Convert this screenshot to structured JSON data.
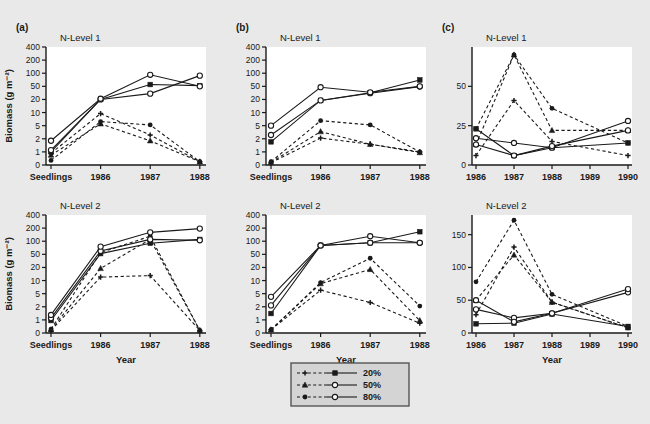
{
  "figure": {
    "background_color": "#e9e9e9",
    "plot_background_color": "#ffffff",
    "ink_color": "#1a1a1a"
  },
  "axis_titles": {
    "y": "Biomass (g m⁻²)",
    "x": "Year"
  },
  "legend": {
    "position": "bottom-center",
    "border_color": "#555555",
    "background_color": "#d4d4d4",
    "entries": [
      {
        "label": "20%",
        "dashed_marker": "plus",
        "solid_marker": "filled-square"
      },
      {
        "label": "50%",
        "dashed_marker": "filled-triangle",
        "solid_marker": "open-circle"
      },
      {
        "label": "80%",
        "dashed_marker": "filled-circle",
        "solid_marker": "open-circle"
      }
    ]
  },
  "panels": [
    {
      "id": "a-top",
      "panel_label": "(a)",
      "title": "N-Level 1",
      "scale": "log",
      "ytick_labels": [
        "0",
        "1",
        "2",
        "5",
        "10",
        "20",
        "50",
        "100",
        "200",
        "400"
      ],
      "ytick_values": [
        0,
        1,
        2,
        5,
        10,
        20,
        50,
        100,
        200,
        400
      ],
      "xtick_labels": [
        "Seedlings",
        "1986",
        "1987",
        "1988"
      ],
      "show_ylabel": true,
      "show_xlabel": false
    },
    {
      "id": "b-top",
      "panel_label": "(b)",
      "title": "N-Level 1",
      "scale": "log",
      "ytick_labels": [
        "0",
        "1",
        "2",
        "5",
        "10",
        "20",
        "50",
        "100",
        "200",
        "400"
      ],
      "ytick_values": [
        0,
        1,
        2,
        5,
        10,
        20,
        50,
        100,
        200,
        400
      ],
      "xtick_labels": [
        "Seedlings",
        "1986",
        "1987",
        "1988"
      ],
      "show_ylabel": false,
      "show_xlabel": false
    },
    {
      "id": "c-top",
      "panel_label": "(c)",
      "title": "N-Level 1",
      "scale": "linear",
      "ytick_labels": [
        "0",
        "25",
        "50"
      ],
      "ytick_values": [
        0,
        25,
        50
      ],
      "ylim": [
        0,
        75
      ],
      "xtick_labels": [
        "1986",
        "1987",
        "1988",
        "1989",
        "1990"
      ],
      "show_ylabel": false,
      "show_xlabel": false
    },
    {
      "id": "a-bottom",
      "panel_label": "",
      "title": "N-Level 2",
      "scale": "log",
      "ytick_labels": [
        "0",
        "1",
        "2",
        "5",
        "10",
        "20",
        "50",
        "100",
        "200",
        "400"
      ],
      "ytick_values": [
        0,
        1,
        2,
        5,
        10,
        20,
        50,
        100,
        200,
        400
      ],
      "xtick_labels": [
        "Seedlings",
        "1986",
        "1987",
        "1988"
      ],
      "show_ylabel": true,
      "show_xlabel": true
    },
    {
      "id": "b-bottom",
      "panel_label": "",
      "title": "N-Level 2",
      "scale": "log",
      "ytick_labels": [
        "0",
        "1",
        "2",
        "5",
        "10",
        "20",
        "50",
        "100",
        "200",
        "400"
      ],
      "ytick_values": [
        0,
        1,
        2,
        5,
        10,
        20,
        50,
        100,
        200,
        400
      ],
      "xtick_labels": [
        "Seedlings",
        "1986",
        "1987",
        "1988"
      ],
      "show_ylabel": false,
      "show_xlabel": true
    },
    {
      "id": "c-bottom",
      "panel_label": "",
      "title": "N-Level 2",
      "scale": "linear",
      "ytick_labels": [
        "0",
        "50",
        "100",
        "150"
      ],
      "ytick_values": [
        0,
        50,
        100,
        150
      ],
      "ylim": [
        0,
        180
      ],
      "xtick_labels": [
        "1986",
        "1987",
        "1988",
        "1989",
        "1990"
      ],
      "show_ylabel": false,
      "show_xlabel": true
    }
  ],
  "chart_data": [
    {
      "id": "a-top",
      "type": "line",
      "title": "N-Level 1",
      "panel_label": "(a)",
      "xlabel": "",
      "ylabel": "Biomass (g m⁻²)",
      "yscale": "log",
      "ylim": [
        0,
        400
      ],
      "grid": false,
      "categories": [
        "Seedlings",
        "1986",
        "1987",
        "1988"
      ],
      "series": [
        {
          "name": "20% dashed",
          "marker": "plus",
          "linestyle": "dashed",
          "values": [
            0.9,
            9.5,
            2.6,
            0.25
          ]
        },
        {
          "name": "50% dashed",
          "marker": "filled-triangle",
          "linestyle": "dashed",
          "values": [
            0.75,
            5.5,
            1.8,
            0.25
          ]
        },
        {
          "name": "80% dashed",
          "marker": "filled-circle",
          "linestyle": "dashed",
          "values": [
            0.35,
            6.2,
            5.2,
            0.25
          ]
        },
        {
          "name": "20% solid",
          "marker": "filled-square",
          "linestyle": "solid",
          "values": [
            1.0,
            20,
            55,
            52
          ]
        },
        {
          "name": "50% solid",
          "marker": "open-circle",
          "linestyle": "solid",
          "values": [
            1.1,
            20,
            30,
            88
          ]
        },
        {
          "name": "80% solid",
          "marker": "open-circle",
          "linestyle": "solid",
          "values": [
            1.8,
            21,
            92,
            50
          ]
        }
      ]
    },
    {
      "id": "b-top",
      "type": "line",
      "title": "N-Level 1",
      "panel_label": "(b)",
      "xlabel": "",
      "ylabel": "",
      "yscale": "log",
      "ylim": [
        0,
        400
      ],
      "grid": false,
      "categories": [
        "Seedlings",
        "1986",
        "1987",
        "1988"
      ],
      "series": [
        {
          "name": "20% dashed",
          "marker": "plus",
          "linestyle": "dashed",
          "values": [
            0.18,
            2.1,
            1.5,
            1.0
          ]
        },
        {
          "name": "50% dashed",
          "marker": "filled-triangle",
          "linestyle": "dashed",
          "values": [
            0.2,
            3.3,
            1.5,
            0.95
          ]
        },
        {
          "name": "80% dashed",
          "marker": "filled-circle",
          "linestyle": "dashed",
          "values": [
            0.25,
            6.5,
            5.2,
            1.0
          ]
        },
        {
          "name": "20% solid",
          "marker": "filled-square",
          "linestyle": "solid",
          "values": [
            1.7,
            19,
            32,
            70
          ]
        },
        {
          "name": "50% solid",
          "marker": "open-circle",
          "linestyle": "solid",
          "values": [
            2.6,
            19,
            31,
            49
          ]
        },
        {
          "name": "80% solid",
          "marker": "open-circle",
          "linestyle": "solid",
          "values": [
            5.0,
            47,
            33,
            50
          ]
        }
      ]
    },
    {
      "id": "c-top",
      "type": "line",
      "title": "N-Level 1",
      "panel_label": "(c)",
      "xlabel": "",
      "ylabel": "",
      "yscale": "linear",
      "ylim": [
        0,
        75
      ],
      "grid": false,
      "categories": [
        "1986",
        "1987",
        "1988",
        "1989",
        "1990"
      ],
      "series": [
        {
          "name": "20% dashed",
          "marker": "plus",
          "linestyle": "dashed",
          "values": [
            6,
            41,
            15,
            null,
            6
          ]
        },
        {
          "name": "50% dashed",
          "marker": "filled-triangle",
          "linestyle": "dashed",
          "values": [
            13,
            70,
            22,
            null,
            22
          ]
        },
        {
          "name": "80% dashed",
          "marker": "filled-circle",
          "linestyle": "dashed",
          "values": [
            23,
            70,
            36,
            null,
            14
          ]
        },
        {
          "name": "20% solid",
          "marker": "filled-square",
          "linestyle": "solid",
          "values": [
            23,
            6,
            11,
            null,
            14
          ]
        },
        {
          "name": "50% solid",
          "marker": "open-circle",
          "linestyle": "solid",
          "values": [
            17,
            14,
            11,
            null,
            28
          ]
        },
        {
          "name": "80% solid",
          "marker": "open-circle",
          "linestyle": "solid",
          "values": [
            13,
            6,
            12,
            null,
            22
          ]
        }
      ]
    },
    {
      "id": "a-bottom",
      "type": "line",
      "title": "N-Level 2",
      "panel_label": "",
      "xlabel": "Year",
      "ylabel": "Biomass (g m⁻²)",
      "yscale": "log",
      "ylim": [
        0,
        400
      ],
      "grid": false,
      "categories": [
        "Seedlings",
        "1986",
        "1987",
        "1988"
      ],
      "series": [
        {
          "name": "20% dashed",
          "marker": "plus",
          "linestyle": "dashed",
          "values": [
            0.2,
            12,
            13,
            0.2
          ]
        },
        {
          "name": "50% dashed",
          "marker": "filled-triangle",
          "linestyle": "dashed",
          "values": [
            0.25,
            19,
            110,
            0.2
          ]
        },
        {
          "name": "80% dashed",
          "marker": "filled-circle",
          "linestyle": "dashed",
          "values": [
            0.3,
            55,
            130,
            0.2
          ]
        },
        {
          "name": "20% solid",
          "marker": "filled-square",
          "linestyle": "solid",
          "values": [
            0.95,
            52,
            90,
            110
          ]
        },
        {
          "name": "50% solid",
          "marker": "open-circle",
          "linestyle": "solid",
          "values": [
            1.1,
            60,
            110,
            105
          ]
        },
        {
          "name": "80% solid",
          "marker": "open-circle",
          "linestyle": "solid",
          "values": [
            1.3,
            75,
            160,
            195
          ]
        }
      ]
    },
    {
      "id": "b-bottom",
      "type": "line",
      "title": "N-Level 2",
      "panel_label": "",
      "xlabel": "Year",
      "ylabel": "",
      "yscale": "log",
      "ylim": [
        0,
        400
      ],
      "grid": false,
      "categories": [
        "Seedlings",
        "1986",
        "1987",
        "1988"
      ],
      "series": [
        {
          "name": "20% dashed",
          "marker": "plus",
          "linestyle": "dashed",
          "values": [
            0.25,
            6.0,
            2.7,
            0.75
          ]
        },
        {
          "name": "50% dashed",
          "marker": "filled-triangle",
          "linestyle": "dashed",
          "values": [
            0.25,
            8.5,
            18,
            0.95
          ]
        },
        {
          "name": "80% dashed",
          "marker": "filled-circle",
          "linestyle": "dashed",
          "values": [
            0.25,
            9.0,
            38,
            2.1
          ]
        },
        {
          "name": "20% solid",
          "marker": "filled-square",
          "linestyle": "solid",
          "values": [
            1.4,
            80,
            92,
            165
          ]
        },
        {
          "name": "50% solid",
          "marker": "open-circle",
          "linestyle": "solid",
          "values": [
            2.2,
            80,
            130,
            92
          ]
        },
        {
          "name": "80% solid",
          "marker": "open-circle",
          "linestyle": "solid",
          "values": [
            4.0,
            80,
            92,
            92
          ]
        }
      ]
    },
    {
      "id": "c-bottom",
      "type": "line",
      "title": "N-Level 2",
      "panel_label": "",
      "xlabel": "Year",
      "ylabel": "",
      "yscale": "linear",
      "ylim": [
        0,
        180
      ],
      "grid": false,
      "categories": [
        "1986",
        "1987",
        "1988",
        "1989",
        "1990"
      ],
      "series": [
        {
          "name": "20% dashed",
          "marker": "plus",
          "linestyle": "dashed",
          "values": [
            28,
            131,
            47,
            null,
            8
          ]
        },
        {
          "name": "50% dashed",
          "marker": "filled-triangle",
          "linestyle": "dashed",
          "values": [
            50,
            119,
            47,
            null,
            8
          ]
        },
        {
          "name": "80% dashed",
          "marker": "filled-circle",
          "linestyle": "dashed",
          "values": [
            78,
            172,
            59,
            null,
            10
          ]
        },
        {
          "name": "20% solid",
          "marker": "filled-square",
          "linestyle": "solid",
          "values": [
            14,
            15,
            29,
            null,
            10
          ]
        },
        {
          "name": "50% solid",
          "marker": "open-circle",
          "linestyle": "solid",
          "values": [
            36,
            23,
            30,
            null,
            62
          ]
        },
        {
          "name": "80% solid",
          "marker": "open-circle",
          "linestyle": "solid",
          "values": [
            50,
            17,
            30,
            null,
            67
          ]
        }
      ]
    }
  ]
}
